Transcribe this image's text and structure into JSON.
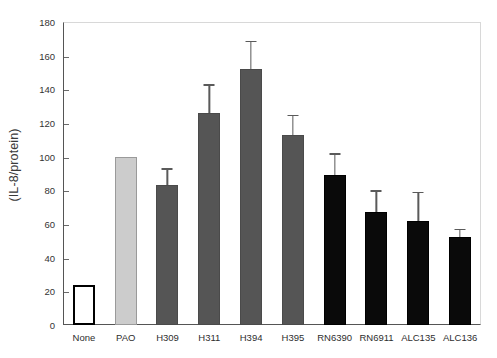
{
  "chart_data": {
    "type": "bar",
    "title": "",
    "xlabel": "",
    "ylabel": "(IL-8/protein)",
    "ylim": [
      0,
      180
    ],
    "ytick_step": 20,
    "yticks": [
      0,
      20,
      40,
      60,
      80,
      100,
      120,
      140,
      160,
      180
    ],
    "grid": false,
    "legend": "none",
    "categories": [
      "None",
      "PAO",
      "H309",
      "H311",
      "H394",
      "H395",
      "RN6390",
      "RN6911",
      "ALC135",
      "ALC136"
    ],
    "values": [
      24,
      100,
      83,
      126,
      152,
      113,
      89,
      67,
      62,
      52
    ],
    "errors": [
      null,
      null,
      10,
      17,
      17,
      12,
      13,
      13,
      17,
      5
    ],
    "bar_styles": [
      "open",
      "lightgray",
      "darkgray",
      "darkgray",
      "darkgray",
      "darkgray",
      "black",
      "black",
      "black",
      "black"
    ],
    "colors": {
      "open_fill": "#ffffff",
      "open_edge": "#000000",
      "lightgray": "#cccccc",
      "darkgray": "#555555",
      "black": "#0a0a0a",
      "axis": "#555555",
      "error_bar": "#5a5a5a"
    }
  }
}
